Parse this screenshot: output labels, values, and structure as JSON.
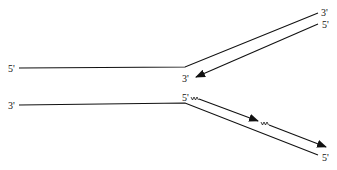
{
  "diagram": {
    "type": "dna-replication-fork",
    "colors": {
      "stroke": "#111111",
      "background": "#ffffff"
    },
    "labels": {
      "top_parent_left": "5'",
      "top_parent_right": "3'",
      "leading_new_start": "5'",
      "leading_new_end": "3'",
      "bottom_parent_left": "3'",
      "lagging_new_start": "5'",
      "bottom_parent_right": "5'"
    }
  }
}
